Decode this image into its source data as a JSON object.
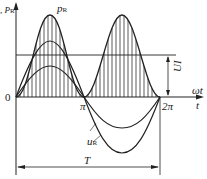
{
  "diagram": {
    "labels": {
      "y_axis": "u, i, p",
      "y_axis_sub": "R",
      "pR_label": "p",
      "pR_sub": "R",
      "origin": "0",
      "pi": "π",
      "two_pi": "2π",
      "omega_t": "ωt",
      "t": "t",
      "i_label": "i",
      "uR_label": "u",
      "uR_sub": "R",
      "UI_label": "UI",
      "period": "T"
    },
    "curves": [
      {
        "name": "p_R",
        "description": "instantaneous power, sin² shape, always positive, hatched area",
        "peak": "2UI"
      },
      {
        "name": "u_R",
        "description": "voltage sine wave, larger amplitude"
      },
      {
        "name": "i",
        "description": "current sine wave, smaller amplitude, in phase with u_R"
      }
    ],
    "average_line": "UI",
    "colors": {
      "stroke": "#222222",
      "background": "#ffffff"
    }
  }
}
